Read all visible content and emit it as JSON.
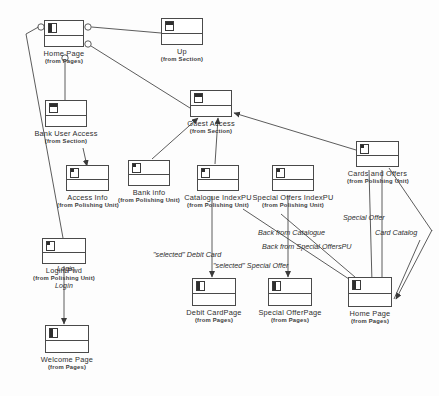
{
  "diagram": {
    "stereotype_prefix": "from",
    "line_color": "#4a4a4a"
  },
  "nodes": [
    {
      "id": "home_page_top",
      "name": "Home Page",
      "package": "(from Pages)",
      "glyph": "page-icon",
      "x": 44,
      "y": 20,
      "w": 40,
      "h": 27
    },
    {
      "id": "up",
      "name": "Up",
      "package": "(from Section)",
      "glyph": "section-icon",
      "x": 161,
      "y": 18,
      "w": 42,
      "h": 27
    },
    {
      "id": "bank_user_access",
      "name": "Bank User Access",
      "package": "(from Section)",
      "glyph": "section-icon",
      "x": 45,
      "y": 100,
      "w": 42,
      "h": 27
    },
    {
      "id": "guest_access",
      "name": "Guest Access",
      "package": "(from Section)",
      "glyph": "section-icon",
      "x": 190,
      "y": 90,
      "w": 42,
      "h": 27
    },
    {
      "id": "access_info",
      "name": "Access Info",
      "package": "(from Polishing Unit)",
      "glyph": "unit-icon",
      "x": 66,
      "y": 165,
      "w": 43,
      "h": 26
    },
    {
      "id": "bank_info",
      "name": "Bank info",
      "package": "(from Polishing Unit)",
      "glyph": "unit-icon",
      "x": 128,
      "y": 160,
      "w": 42,
      "h": 26
    },
    {
      "id": "catalogue_index",
      "name": "Catalogue IndexPU",
      "package": "(from Polishing Unit)",
      "glyph": "unit-icon",
      "x": 197,
      "y": 165,
      "w": 42,
      "h": 26
    },
    {
      "id": "cards_and_offers",
      "name": "Cards and Offers",
      "package": "(from Polishing Unit)",
      "glyph": "unit-icon",
      "x": 356,
      "y": 141,
      "w": 43,
      "h": 26
    },
    {
      "id": "special_offers_index",
      "name": "Special Offers IndexPU",
      "package": "(from Polishing Unit)",
      "glyph": "unit-icon",
      "x": 272,
      "y": 165,
      "w": 42,
      "h": 26
    },
    {
      "id": "login_pwd",
      "name": "Login/Pwd",
      "package": "(from Polishing Unit)",
      "glyph": "unit-icon",
      "x": 42,
      "y": 238,
      "w": 44,
      "h": 26,
      "extra": "Login"
    },
    {
      "id": "debit_card_page",
      "name": "Debit CardPage",
      "package": "(from Pages)",
      "glyph": "page-icon",
      "x": 192,
      "y": 278,
      "w": 44,
      "h": 28
    },
    {
      "id": "special_offer_page",
      "name": "Special OfferPage",
      "package": "(from Pages)",
      "glyph": "page-icon",
      "x": 268,
      "y": 278,
      "w": 44,
      "h": 28
    },
    {
      "id": "home_page_bottom",
      "name": "Home Page",
      "package": "(from Pages)",
      "glyph": "page-icon",
      "x": 348,
      "y": 277,
      "w": 44,
      "h": 30
    },
    {
      "id": "welcome_page",
      "name": "Welcome Page",
      "package": "(from Pages)",
      "glyph": "page-icon",
      "x": 45,
      "y": 325,
      "w": 44,
      "h": 28
    }
  ],
  "edge_labels": [
    {
      "id": "sel_debit_card",
      "text": "\"selected\" Debit Card",
      "x": 153,
      "y": 251
    },
    {
      "id": "sel_special_offer",
      "text": "\"selected\" Special Offer",
      "x": 213,
      "y": 262
    },
    {
      "id": "back_from_catalogue",
      "text": "Back from Catalogue",
      "x": 258,
      "y": 229
    },
    {
      "id": "back_from_so_pu",
      "text": "Back from Special OffersPU",
      "x": 262,
      "y": 243
    },
    {
      "id": "special_offer",
      "text": "Special Offer",
      "x": 343,
      "y": 214
    },
    {
      "id": "card_catalog",
      "text": "Card Catalog",
      "x": 375,
      "y": 229
    },
    {
      "id": "login_link",
      "text": "Login",
      "x": 57,
      "y": 265
    }
  ]
}
